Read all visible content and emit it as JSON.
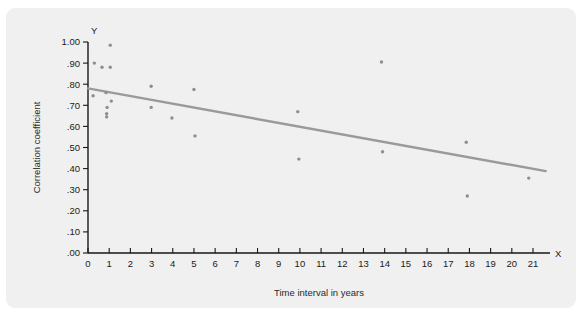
{
  "chart_data": {
    "type": "scatter",
    "title": "",
    "xlabel": "Time interval in years",
    "ylabel": "Correlation coefficient",
    "x_axis_name": "X",
    "y_axis_name": "Y",
    "xlim": [
      0,
      21.8
    ],
    "ylim": [
      0.0,
      1.0
    ],
    "grid": false,
    "legend": null,
    "x_ticks": [
      0,
      1,
      2,
      3,
      4,
      5,
      6,
      7,
      8,
      9,
      10,
      11,
      12,
      13,
      14,
      15,
      16,
      17,
      18,
      19,
      20,
      21
    ],
    "x_tick_labels": [
      "0",
      "1",
      "2",
      "3",
      "4",
      "5",
      "6",
      "7",
      "8",
      "9",
      "10",
      "11",
      "12",
      "13",
      "14",
      "15",
      "16",
      "17",
      "18",
      "19",
      "20",
      "21"
    ],
    "y_ticks": [
      0.0,
      0.1,
      0.2,
      0.3,
      0.4,
      0.5,
      0.6,
      0.7,
      0.8,
      0.9,
      1.0
    ],
    "y_tick_labels": [
      ".00",
      ".10",
      ".20",
      ".30",
      ".40",
      ".50",
      ".60",
      ".70",
      ".80",
      ".90",
      "1.00"
    ],
    "points": [
      {
        "x": 1.05,
        "y": 0.985
      },
      {
        "x": 0.3,
        "y": 0.9
      },
      {
        "x": 0.66,
        "y": 0.88
      },
      {
        "x": 1.05,
        "y": 0.88
      },
      {
        "x": 0.85,
        "y": 0.76
      },
      {
        "x": 0.24,
        "y": 0.745
      },
      {
        "x": 1.1,
        "y": 0.72
      },
      {
        "x": 0.9,
        "y": 0.69
      },
      {
        "x": 0.88,
        "y": 0.66
      },
      {
        "x": 0.88,
        "y": 0.645
      },
      {
        "x": 2.98,
        "y": 0.79
      },
      {
        "x": 2.98,
        "y": 0.69
      },
      {
        "x": 3.96,
        "y": 0.64
      },
      {
        "x": 5.0,
        "y": 0.775
      },
      {
        "x": 5.05,
        "y": 0.555
      },
      {
        "x": 9.9,
        "y": 0.67
      },
      {
        "x": 9.95,
        "y": 0.445
      },
      {
        "x": 13.85,
        "y": 0.905
      },
      {
        "x": 13.9,
        "y": 0.48
      },
      {
        "x": 17.85,
        "y": 0.525
      },
      {
        "x": 17.9,
        "y": 0.27
      },
      {
        "x": 20.8,
        "y": 0.355
      }
    ],
    "trend_line": {
      "x0": 0.0,
      "y0": 0.78,
      "x1": 21.6,
      "y1": 0.388,
      "color": "#9a9a9a"
    },
    "colors": {
      "point": "#8e8e8e",
      "axis": "#171717",
      "panel_background": "#f0f0f0",
      "page_background": "#ffffff"
    }
  }
}
